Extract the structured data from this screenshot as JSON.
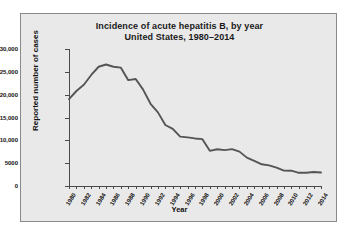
{
  "chart_data": {
    "type": "line",
    "title": "Incidence of acute hepatitis B, by year\nUnited States, 1980–2014",
    "title_line1": "Incidence of acute hepatitis B, by year",
    "title_line2": "United States, 1980–2014",
    "xlabel": "Year",
    "ylabel": "Reported number of cases",
    "ylim": [
      0,
      30000
    ],
    "xlim": [
      1980,
      2014
    ],
    "grid": false,
    "legend": false,
    "line_color": "#555555",
    "panel_color": "#e9e9e9",
    "ytick_labels": [
      "0",
      "5000",
      "10,000",
      "15,000",
      "20,000",
      "25,000",
      "30,000"
    ],
    "ytick_values": [
      0,
      5000,
      10000,
      15000,
      20000,
      25000,
      30000
    ],
    "xtick_labels": [
      "1980",
      "1982",
      "1984",
      "1986",
      "1988",
      "1990",
      "1992",
      "1994",
      "1996",
      "1998",
      "2000",
      "2002",
      "2004",
      "2006",
      "2008",
      "2010",
      "2012",
      "2014"
    ],
    "x": [
      1980,
      1981,
      1982,
      1983,
      1984,
      1985,
      1986,
      1987,
      1988,
      1989,
      1990,
      1991,
      1992,
      1993,
      1994,
      1995,
      1996,
      1997,
      1998,
      1999,
      2000,
      2001,
      2002,
      2003,
      2004,
      2005,
      2006,
      2007,
      2008,
      2009,
      2010,
      2011,
      2012,
      2013,
      2014
    ],
    "values": [
      19015,
      20800,
      22177,
      24318,
      26115,
      26611,
      26107,
      25916,
      23177,
      23419,
      21102,
      18003,
      16126,
      13361,
      12517,
      10805,
      10637,
      10416,
      10258,
      7694,
      8036,
      7844,
      8064,
      7526,
      6212,
      5494,
      4758,
      4519,
      4033,
      3371,
      3350,
      2890,
      2895,
      3050,
      2953
    ]
  }
}
